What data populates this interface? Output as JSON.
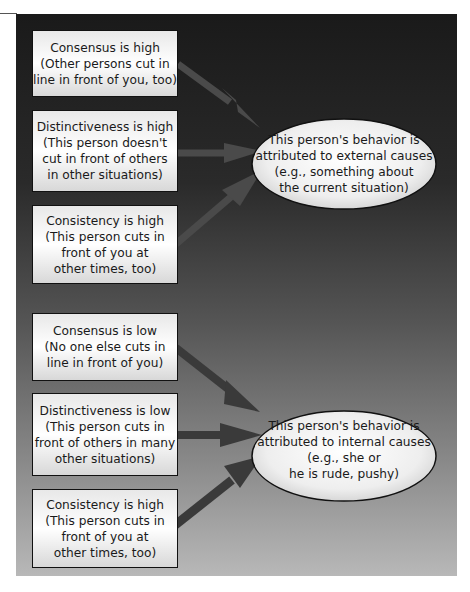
{
  "diagram": {
    "type": "attribution-flow",
    "colors": {
      "panel_top": "#1a1a1a",
      "panel_bottom": "#b8b8b8",
      "box_fill": "#f4f4f4",
      "arrow_top": "#4a4a4a",
      "arrow_bottom": "#3a3a3a"
    },
    "external_group": {
      "inputs": [
        {
          "lines": [
            "Consensus is high",
            "(Other persons cut in",
            "line in front of you, too)"
          ]
        },
        {
          "lines": [
            "Distinctiveness is high",
            "(This person doesn't",
            "cut in front of others",
            "in other situations)"
          ]
        },
        {
          "lines": [
            "Consistency is high",
            "(This person cuts in",
            "front of you at",
            "other times, too)"
          ]
        }
      ],
      "outcome": {
        "lines": [
          "This person's behavior is",
          "attributed to external causes",
          "(e.g., something about",
          "the current situation)"
        ]
      }
    },
    "internal_group": {
      "inputs": [
        {
          "lines": [
            "Consensus is low",
            "(No one else cuts in",
            "line in front of you)"
          ]
        },
        {
          "lines": [
            "Distinctiveness is low",
            "(This person cuts in",
            "front of others in many",
            "other situations)"
          ]
        },
        {
          "lines": [
            "Consistency is high",
            "(This person cuts in",
            "front of you at",
            "other times, too)"
          ]
        }
      ],
      "outcome": {
        "lines": [
          "This person's behavior is",
          "attributed to internal causes",
          "(e.g., she or",
          "he is rude, pushy)"
        ]
      }
    }
  }
}
